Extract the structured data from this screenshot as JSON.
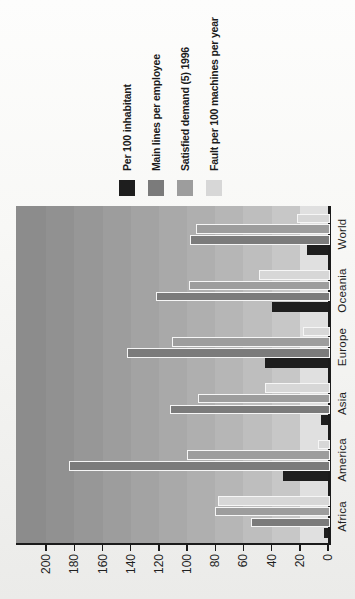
{
  "chart_data": {
    "type": "bar",
    "rotation": "whole chart rotated 90 degrees counterclockwise on the page",
    "categories": [
      "Africa",
      "America",
      "Asia",
      "Europe",
      "Oceania",
      "World"
    ],
    "series": [
      {
        "name": "Per 100 inhabitant",
        "color": "#1e1e1e",
        "values": [
          3,
          32,
          5,
          45,
          40,
          15
        ]
      },
      {
        "name": "Main lines per employee",
        "color": "#7b7b7b",
        "values": [
          55,
          184,
          112,
          143,
          122,
          98
        ]
      },
      {
        "name": "Satisfied demand (5) 1996",
        "color": "#9d9d9d",
        "values": [
          80,
          100,
          92,
          111,
          99,
          94
        ]
      },
      {
        "name": "Fault per 100 machines per year",
        "color": "#d7d7d7",
        "values": [
          78,
          7,
          45,
          18,
          49,
          22
        ]
      }
    ],
    "value_axis": {
      "min": 0,
      "max": 200,
      "tick_step": 20,
      "ticks": [
        0,
        20,
        40,
        60,
        80,
        100,
        120,
        140,
        160,
        180,
        200
      ],
      "plot_top_value": 220
    },
    "legend_position": "right of plot in unrotated orientation (appears on top after rotation)",
    "grid": "stepped shaded background bands, one per 20 units, lighter toward 0",
    "band_colors_bottom_to_top": [
      "#e0e0e0",
      "#c7c7c7",
      "#bebebe",
      "#b6b6b6",
      "#afafaf",
      "#a9a9a9",
      "#a3a3a3",
      "#9d9d9d",
      "#979797",
      "#919191",
      "#8c8c8c"
    ],
    "bar_border_color": "#f6f6f6",
    "axis_line_color": "#1b1b1b",
    "text_color": "#1f1f1f",
    "background_top": "#fdfdfc",
    "background_bottom": "#ebebe9"
  }
}
